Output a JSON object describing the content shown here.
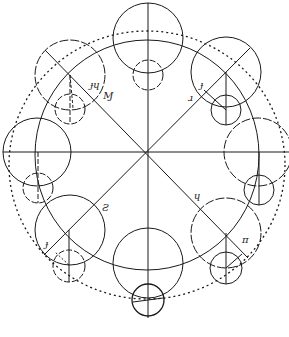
{
  "diagram": {
    "title": "",
    "center": {
      "x": 147,
      "y": 152
    },
    "stroke_color": "#1a1a1a",
    "background": "#ffffff",
    "labels": [
      {
        "id": "upper-left-label-1",
        "text": "ɟɥ",
        "x": 93,
        "y": 88
      },
      {
        "id": "upper-left-label-2",
        "text": "Ɱ",
        "x": 105,
        "y": 99
      },
      {
        "id": "upper-right-label-1",
        "text": "ɟ",
        "x": 202,
        "y": 88
      },
      {
        "id": "upper-right-label-2",
        "text": "ɹ",
        "x": 190,
        "y": 101
      },
      {
        "id": "lower-left-label-1",
        "text": "Ƨ",
        "x": 103,
        "y": 211
      },
      {
        "id": "lower-left-label-2",
        "text": "ɟ",
        "x": 47,
        "y": 247
      },
      {
        "id": "lower-right-label-1",
        "text": "ɥ",
        "x": 196,
        "y": 199
      },
      {
        "id": "lower-right-label-2",
        "text": "π",
        "x": 245,
        "y": 243
      }
    ]
  }
}
